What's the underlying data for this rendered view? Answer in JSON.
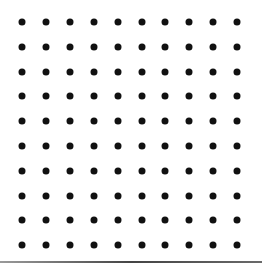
{
  "grid": {
    "rows": 10,
    "cols": 10,
    "origin_x": 22,
    "origin_y": 22,
    "spacing_x": 23.9,
    "spacing_y": 24.8,
    "dot_diameter": 7,
    "dot_color": "#111111"
  },
  "background_color": "#ffffff",
  "bottom_rule": {
    "visible": true,
    "color": "#555555"
  }
}
